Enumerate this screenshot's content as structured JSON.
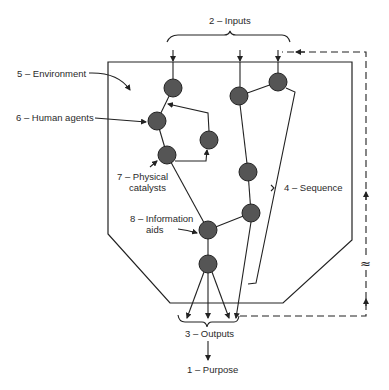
{
  "diagram": {
    "type": "system-model",
    "labels": {
      "inputs": "2 – Inputs",
      "environment": "5 – Environment",
      "human_agents": "6 – Human agents",
      "physical_catalysts_line1": "7 – Physical",
      "physical_catalysts_line2": "catalysts",
      "sequence": "4 – Sequence",
      "information_aids_line1": "8 – Information",
      "information_aids_line2": "aids",
      "outputs": "3 – Outputs",
      "purpose": "1 – Purpose",
      "break_symbol": "≈"
    },
    "colors": {
      "node_fill": "#555555",
      "line": "#222222",
      "background": "#ffffff"
    },
    "nodes": [
      {
        "id": "n1",
        "x": 173,
        "y": 88
      },
      {
        "id": "n2",
        "x": 157,
        "y": 121
      },
      {
        "id": "n3",
        "x": 167,
        "y": 155
      },
      {
        "id": "n4",
        "x": 209,
        "y": 140
      },
      {
        "id": "n5",
        "x": 239,
        "y": 96
      },
      {
        "id": "n6",
        "x": 278,
        "y": 82
      },
      {
        "id": "n7",
        "x": 248,
        "y": 172
      },
      {
        "id": "n8",
        "x": 208,
        "y": 230
      },
      {
        "id": "n9",
        "x": 208,
        "y": 264
      },
      {
        "id": "n10",
        "x": 251,
        "y": 213
      }
    ]
  }
}
